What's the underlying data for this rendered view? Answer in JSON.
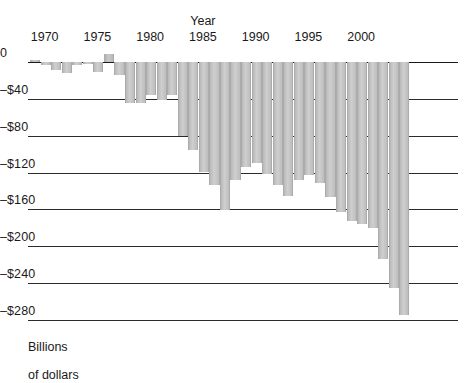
{
  "chart_data": {
    "type": "bar",
    "title": "",
    "xlabel": "Year",
    "ylabel": "Billions\nof dollars",
    "ylim": [
      -280,
      10
    ],
    "ytick_values": [
      0,
      -40,
      -80,
      -120,
      -160,
      -200,
      -240,
      -280
    ],
    "ytick_labels": [
      "0",
      "–$40",
      "–$80",
      "–$120",
      "–$160",
      "–$200",
      "–$240",
      "–$280"
    ],
    "xtick_values": [
      1970,
      1975,
      1980,
      1985,
      1990,
      1995,
      2000
    ],
    "xtick_labels": [
      "1970",
      "1975",
      "1980",
      "1985",
      "1990",
      "1995",
      "2000"
    ],
    "grid": true,
    "legend": "none",
    "x_axis_position": "top",
    "categories": [
      1969,
      1970,
      1971,
      1972,
      1973,
      1974,
      1975,
      1976,
      1977,
      1978,
      1979,
      1980,
      1981,
      1982,
      1983,
      1984,
      1985,
      1986,
      1987,
      1988,
      1989,
      1990,
      1991,
      1992,
      1993,
      1994,
      1995,
      1996,
      1997,
      1998,
      1999,
      2000,
      2001,
      2002,
      2003,
      2004
    ],
    "values": [
      3,
      -3,
      -23,
      -23,
      -15,
      -6,
      8,
      -53,
      -54,
      -59,
      -41,
      -74,
      -79,
      -128,
      -208,
      -185,
      -212,
      -221,
      -150,
      -155,
      -153,
      -221,
      -269,
      -290,
      -255,
      -203,
      -164,
      -107,
      -22,
      69,
      126,
      236,
      128,
      -158,
      -375,
      -413
    ]
  },
  "rendered_bars": [
    {
      "year": 1969,
      "value": 2,
      "px_depth": 2,
      "sign": "positive"
    },
    {
      "year": 1970,
      "value": -3,
      "px_depth": 3,
      "sign": "negative"
    },
    {
      "year": 1971,
      "value": -9,
      "px_depth": 8,
      "sign": "negative"
    },
    {
      "year": 1972,
      "value": -12,
      "px_depth": 11,
      "sign": "negative"
    },
    {
      "year": 1973,
      "value": -3,
      "px_depth": 3,
      "sign": "negative"
    },
    {
      "year": 1974,
      "value": -2,
      "px_depth": 2,
      "sign": "negative"
    },
    {
      "year": 1975,
      "value": -11,
      "px_depth": 10,
      "sign": "negative"
    },
    {
      "year": 1976,
      "value": 8,
      "px_depth": 8,
      "sign": "positive"
    },
    {
      "year": 1977,
      "value": -14,
      "px_depth": 13,
      "sign": "negative"
    },
    {
      "year": 1978,
      "value": -44,
      "px_depth": 41,
      "sign": "negative"
    },
    {
      "year": 1979,
      "value": -45,
      "px_depth": 41,
      "sign": "negative"
    },
    {
      "year": 1980,
      "value": -36,
      "px_depth": 33,
      "sign": "negative"
    },
    {
      "year": 1981,
      "value": -41,
      "px_depth": 38,
      "sign": "negative"
    },
    {
      "year": 1982,
      "value": -36,
      "px_depth": 33,
      "sign": "negative"
    },
    {
      "year": 1983,
      "value": -80,
      "px_depth": 74,
      "sign": "negative"
    },
    {
      "year": 1984,
      "value": -95,
      "px_depth": 88,
      "sign": "negative"
    },
    {
      "year": 1985,
      "value": -119,
      "px_depth": 110,
      "sign": "negative"
    },
    {
      "year": 1986,
      "value": -133,
      "px_depth": 123,
      "sign": "negative"
    },
    {
      "year": 1987,
      "value": -160,
      "px_depth": 148,
      "sign": "negative"
    },
    {
      "year": 1988,
      "value": -128,
      "px_depth": 118,
      "sign": "negative"
    },
    {
      "year": 1989,
      "value": -114,
      "px_depth": 105,
      "sign": "negative"
    },
    {
      "year": 1990,
      "value": -110,
      "px_depth": 101,
      "sign": "negative"
    },
    {
      "year": 1991,
      "value": -121,
      "px_depth": 112,
      "sign": "negative"
    },
    {
      "year": 1992,
      "value": -133,
      "px_depth": 123,
      "sign": "negative"
    },
    {
      "year": 1993,
      "value": -145,
      "px_depth": 134,
      "sign": "negative"
    },
    {
      "year": 1994,
      "value": -128,
      "px_depth": 118,
      "sign": "negative"
    },
    {
      "year": 1995,
      "value": -122,
      "px_depth": 113,
      "sign": "negative"
    },
    {
      "year": 1996,
      "value": -131,
      "px_depth": 121,
      "sign": "negative"
    },
    {
      "year": 1997,
      "value": -147,
      "px_depth": 135,
      "sign": "negative"
    },
    {
      "year": 1998,
      "value": -163,
      "px_depth": 150,
      "sign": "negative"
    },
    {
      "year": 1999,
      "value": -172,
      "px_depth": 159,
      "sign": "negative"
    },
    {
      "year": 2000,
      "value": -176,
      "px_depth": 162,
      "sign": "negative"
    },
    {
      "year": 2001,
      "value": -180,
      "px_depth": 166,
      "sign": "negative"
    },
    {
      "year": 2002,
      "value": -214,
      "px_depth": 197,
      "sign": "negative"
    },
    {
      "year": 2003,
      "value": -245,
      "px_depth": 226,
      "sign": "negative"
    },
    {
      "year": 2004,
      "value": -275,
      "px_depth": 253,
      "sign": "negative"
    }
  ],
  "axes": {
    "x_title": "Year",
    "y_title_line1": "Billions",
    "y_title_line2": "of dollars"
  },
  "colors": {
    "bar_fill": "#c6c6c6",
    "bar_edge": "#ababab",
    "axis": "#1a1a1a",
    "background": "#ffffff",
    "text": "#1a1a1a"
  }
}
